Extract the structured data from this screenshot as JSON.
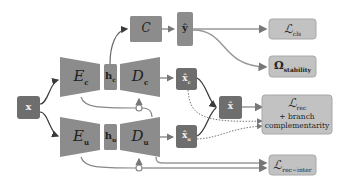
{
  "colors": {
    "block": "#8c8c8c",
    "dark": "#6e6e6e",
    "loss": "#c2c2c2",
    "loss_border": "#a8a8a8",
    "arrow": "#777777",
    "dark_arrow": "#3a3a3a"
  },
  "nodes": {
    "x": "x",
    "Ec": "E",
    "Ec_sub": "c",
    "Eu": "E",
    "Eu_sub": "u",
    "hc": "h",
    "hc_sub": "c",
    "hu": "h",
    "hu_sub": "u",
    "Dc": "D",
    "Dc_sub": "c",
    "Du": "D",
    "Du_sub": "u",
    "C": "C",
    "yhat": "ŷ",
    "xhat_c": "x̂",
    "xhat_c_sub": "c",
    "xhat_u": "x̂",
    "xhat_u_sub": "u",
    "xhat": "x̂"
  },
  "losses": {
    "cls": {
      "main": "ℒ",
      "sub": "cls"
    },
    "stability": {
      "main": "Ω",
      "sub": "stability"
    },
    "rec": {
      "main": "ℒ",
      "sub": "rec",
      "line2": "+ branch",
      "line3": "complementarity"
    },
    "rec_inter": {
      "main": "ℒ",
      "sub": "rec−inter"
    }
  }
}
